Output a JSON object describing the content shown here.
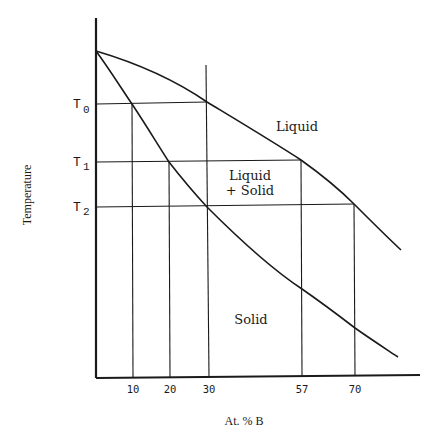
{
  "diagram": {
    "type": "binary-phase-diagram",
    "y_axis_label": "Temperature",
    "x_axis_label": "At. % B",
    "temperature_levels": [
      {
        "main": "T",
        "sub": "0"
      },
      {
        "main": "T",
        "sub": "1"
      },
      {
        "main": "T",
        "sub": "2"
      }
    ],
    "x_ticks": [
      "10",
      "20",
      "30",
      "57",
      "70"
    ],
    "regions": {
      "liquid": "Liquid",
      "two_phase_line1": "Liquid",
      "two_phase_line2": "+ Solid",
      "solid": "Solid"
    },
    "curves": [
      "liquidus",
      "solidus"
    ],
    "tie_lines": [
      {
        "temperature": "T0",
        "solid_composition": 10,
        "liquid_composition": 30
      },
      {
        "temperature": "T1",
        "solid_composition": 20,
        "liquid_composition": 57
      },
      {
        "temperature": "T2",
        "solid_composition": 30,
        "liquid_composition": 70
      }
    ],
    "line_color": "#1a1a1a",
    "background": "#ffffff"
  }
}
